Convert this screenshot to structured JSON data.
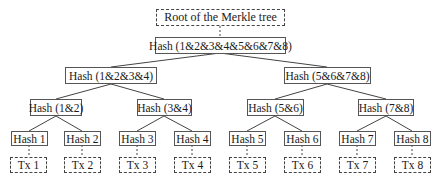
{
  "diagram": {
    "type": "merkle-tree",
    "root": {
      "label": "Root of the Merkle tree",
      "style": "dashed"
    },
    "level0": {
      "label": "Hash (1&2&3&4&5&6&7&8)"
    },
    "level1": [
      {
        "label": "Hash (1&2&3&4)"
      },
      {
        "label": "Hash (5&6&7&8)"
      }
    ],
    "level2": [
      {
        "label": "Hash (1&2)"
      },
      {
        "label": "Hash (3&4)"
      },
      {
        "label": "Hash (5&6)"
      },
      {
        "label": "Hash (7&8)"
      }
    ],
    "leaves": [
      {
        "label": "Hash 1"
      },
      {
        "label": "Hash 2"
      },
      {
        "label": "Hash 3"
      },
      {
        "label": "Hash 4"
      },
      {
        "label": "Hash 5"
      },
      {
        "label": "Hash 6"
      },
      {
        "label": "Hash 7"
      },
      {
        "label": "Hash 8"
      }
    ],
    "transactions": [
      {
        "label": "Tx 1"
      },
      {
        "label": "Tx 2"
      },
      {
        "label": "Tx 3"
      },
      {
        "label": "Tx 4"
      },
      {
        "label": "Tx 5"
      },
      {
        "label": "Tx 6"
      },
      {
        "label": "Tx 7"
      },
      {
        "label": "Tx 8"
      }
    ],
    "colors": {
      "border": "#555555",
      "text": "#1a1a1a",
      "background": "#ffffff"
    }
  }
}
